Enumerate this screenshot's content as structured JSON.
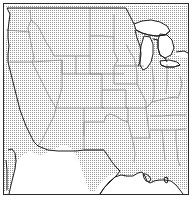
{
  "figure": {
    "type": "reference-map",
    "title": "",
    "projection_note": "conic",
    "frame": {
      "visible": true,
      "line_color": "#2b2b2b",
      "line_width_px": 1
    }
  },
  "style": {
    "land_fill_pattern": "stipple-dot-screen",
    "land_fill_color": "#9a9a9a",
    "land_background": "#ffffff",
    "water_fill_color": "#ffffff",
    "state_border_color": "#7d7d7d",
    "coastline_color": "#1e1e1e",
    "international_border_color": "#1e1e1e",
    "lake_outline_color": "#1e1e1e"
  },
  "legend": {
    "present": false,
    "entries": []
  },
  "labels": {
    "present": false,
    "items": []
  },
  "water_bodies": [
    {
      "name": "pacific-ocean",
      "fill": "#ffffff"
    },
    {
      "name": "gulf-of-mexico",
      "fill": "#ffffff"
    },
    {
      "name": "lake-superior",
      "fill": "#ffffff"
    },
    {
      "name": "lake-michigan",
      "fill": "#ffffff"
    },
    {
      "name": "lake-huron",
      "fill": "#ffffff"
    },
    {
      "name": "lake-erie",
      "fill": "#ffffff"
    },
    {
      "name": "lake-ontario",
      "fill": "#ffffff"
    }
  ],
  "regions_visible": [
    "washington",
    "oregon",
    "california",
    "idaho",
    "nevada",
    "utah",
    "arizona",
    "montana",
    "wyoming",
    "colorado",
    "new-mexico",
    "north-dakota",
    "south-dakota",
    "nebraska",
    "kansas",
    "oklahoma",
    "texas",
    "minnesota",
    "iowa",
    "missouri",
    "arkansas",
    "louisiana",
    "wisconsin",
    "illinois",
    "michigan",
    "indiana",
    "ohio",
    "kentucky",
    "tennessee",
    "mississippi",
    "alabama",
    "georgia",
    "west-virginia",
    "baja-california"
  ]
}
